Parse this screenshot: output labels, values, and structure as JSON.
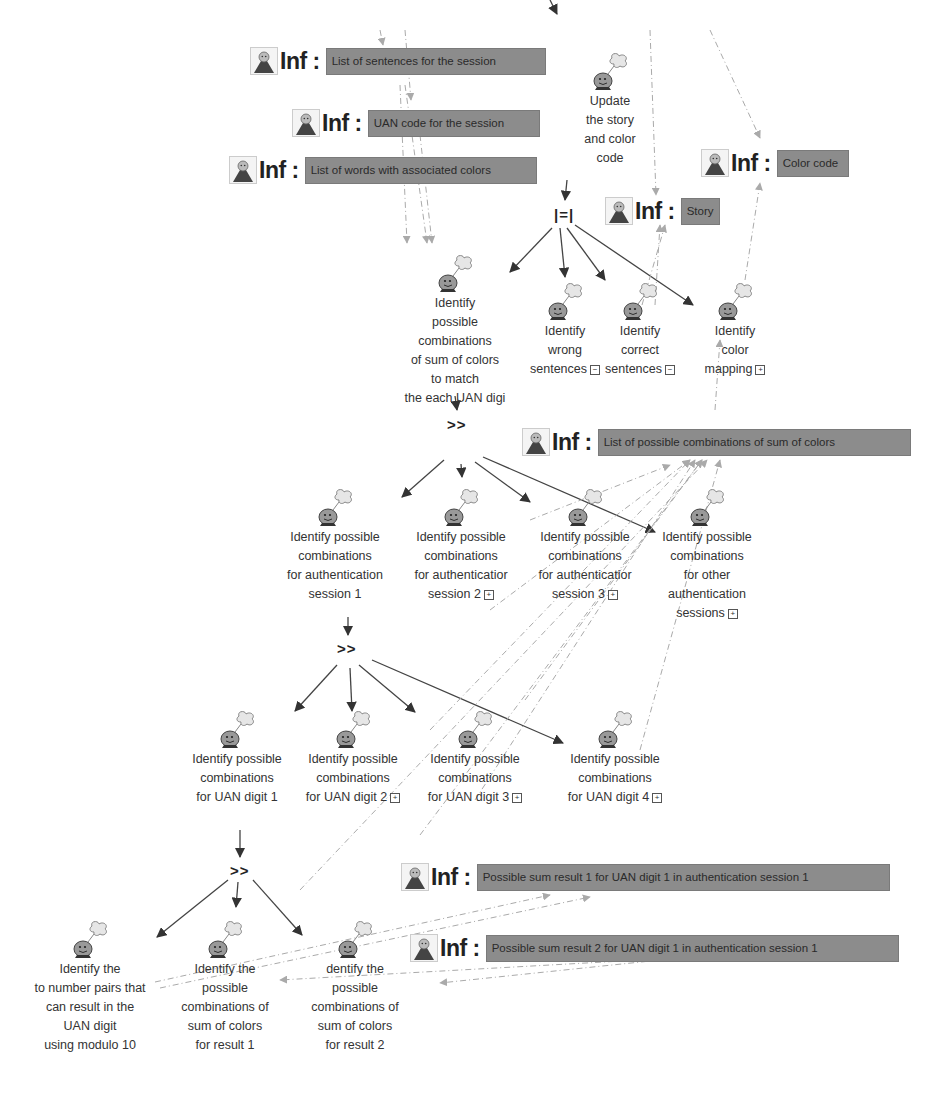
{
  "diagram": {
    "info_nodes": [
      {
        "id": "inf-sentences",
        "prefix": "Inf :",
        "text": "List of sentences for the session",
        "x": 250,
        "y": 46,
        "boxw": 220
      },
      {
        "id": "inf-uan",
        "prefix": "Inf :",
        "text": "UAN code for the session",
        "x": 292,
        "y": 108,
        "boxw": 172
      },
      {
        "id": "inf-words",
        "prefix": "Inf :",
        "text": "List of words with associated colors",
        "x": 229,
        "y": 155,
        "boxw": 232
      },
      {
        "id": "inf-story",
        "prefix": "Inf :",
        "text": "Story",
        "x": 605,
        "y": 196,
        "boxw": 38
      },
      {
        "id": "inf-colorcode",
        "prefix": "Inf :",
        "text": "Color code",
        "x": 701,
        "y": 148,
        "boxw": 72
      },
      {
        "id": "inf-combinations",
        "prefix": "Inf :",
        "text": "List of possible combinations of sum of colors",
        "x": 522,
        "y": 427,
        "boxw": 313
      },
      {
        "id": "inf-sum1",
        "prefix": "Inf :",
        "text": "Possible sum result 1 for UAN digit 1 in authentication session 1",
        "x": 401,
        "y": 862,
        "boxw": 413
      },
      {
        "id": "inf-sum2",
        "prefix": "Inf :",
        "text": "Possible sum result 2 for UAN digit 1 in authentication session 1",
        "x": 410,
        "y": 933,
        "boxw": 413
      }
    ],
    "tasks": [
      {
        "id": "t-update",
        "label": "Update\nthe story\nand color\ncode",
        "x": 575,
        "y": 52,
        "w": 70,
        "expand": ""
      },
      {
        "id": "t-identify-comb",
        "label": "Identify\npossible\ncombinations\nof sum of colors\nto match\nthe each UAN digi",
        "x": 385,
        "y": 254,
        "w": 140,
        "expand": ""
      },
      {
        "id": "t-wrong",
        "label": "Identify\nwrong\nsentences",
        "x": 530,
        "y": 282,
        "w": 70,
        "expand": "−"
      },
      {
        "id": "t-correct",
        "label": "Identify\ncorrect\nsentences",
        "x": 605,
        "y": 282,
        "w": 70,
        "expand": "−"
      },
      {
        "id": "t-colormap",
        "label": "Identify\ncolor\nmapping",
        "x": 700,
        "y": 282,
        "w": 70,
        "expand": "+"
      },
      {
        "id": "t-session1",
        "label": "Identify possible\ncombinations\nfor authentication\nsession 1",
        "x": 280,
        "y": 488,
        "w": 110,
        "expand": ""
      },
      {
        "id": "t-session2",
        "label": "Identify possible\ncombinations\nfor authenticatior\nsession 2",
        "x": 406,
        "y": 488,
        "w": 110,
        "expand": "+"
      },
      {
        "id": "t-session3",
        "label": "Identify possible\ncombinations\nfor authenticatior\nsession 3",
        "x": 530,
        "y": 488,
        "w": 110,
        "expand": "+"
      },
      {
        "id": "t-session-other",
        "label": "Identify possible\ncombinations\nfor other\nauthentication\nsessions",
        "x": 652,
        "y": 488,
        "w": 110,
        "expand": "+"
      },
      {
        "id": "t-digit1",
        "label": "Identify possible\ncombinations\nfor UAN digit 1",
        "x": 182,
        "y": 710,
        "w": 110,
        "expand": ""
      },
      {
        "id": "t-digit2",
        "label": "Identify possible\ncombinations\nfor UAN digit 2",
        "x": 298,
        "y": 710,
        "w": 110,
        "expand": "+"
      },
      {
        "id": "t-digit3",
        "label": "Identify possible\ncombinations\nfor UAN digit 3",
        "x": 420,
        "y": 710,
        "w": 110,
        "expand": "+"
      },
      {
        "id": "t-digit4",
        "label": "Identify possible\ncombinations\nfor UAN digit 4",
        "x": 560,
        "y": 710,
        "w": 110,
        "expand": "+"
      },
      {
        "id": "t-pairs",
        "label": "Identify the\nto number pairs that\ncan result in the\nUAN digit\nusing modulo 10",
        "x": 25,
        "y": 920,
        "w": 130,
        "expand": ""
      },
      {
        "id": "t-result1",
        "label": "Identify the\npossible\ncombinations of\nsum of colors\nfor result 1",
        "x": 170,
        "y": 920,
        "w": 110,
        "expand": ""
      },
      {
        "id": "t-result2",
        "label": "dentify the\npossible\ncombinations of\nsum of colors\nfor result 2",
        "x": 300,
        "y": 920,
        "w": 110,
        "expand": ""
      }
    ],
    "operators": [
      {
        "id": "op-interleave",
        "symbol": "|=|",
        "x": 554,
        "y": 206
      },
      {
        "id": "op-enable-1",
        "symbol": ">>",
        "x": 447,
        "y": 416
      },
      {
        "id": "op-enable-2",
        "symbol": ">>",
        "x": 337,
        "y": 640
      },
      {
        "id": "op-enable-3",
        "symbol": ">>",
        "x": 230,
        "y": 862
      }
    ]
  }
}
